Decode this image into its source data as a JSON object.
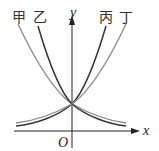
{
  "diagram": {
    "type": "function-graph",
    "axes": {
      "x_label": "x",
      "y_label": "y",
      "origin_label": "O"
    },
    "curves": [
      {
        "label": "甲",
        "color": "#8a8a8a"
      },
      {
        "label": "乙",
        "color": "#3a3a3a"
      },
      {
        "label": "丙",
        "color": "#3a3a3a"
      },
      {
        "label": "丁",
        "color": "#8a8a8a"
      }
    ],
    "intersection": "(0,1)"
  }
}
